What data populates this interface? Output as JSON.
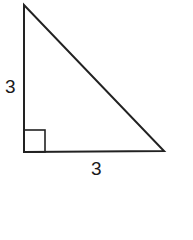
{
  "diagram": {
    "type": "right-triangle",
    "stroke_color": "#222222",
    "vertices": {
      "top": [
        24,
        5
      ],
      "right_angle": [
        24,
        152
      ],
      "bottom_right": [
        164,
        151
      ]
    },
    "right_angle_marker": {
      "x": 24,
      "y": 130,
      "size": 22
    },
    "labels": {
      "vertical_leg": "3",
      "horizontal_leg": "3"
    }
  }
}
